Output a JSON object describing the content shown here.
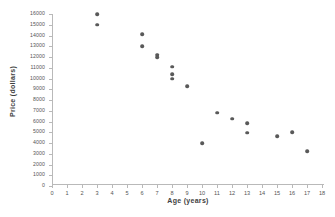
{
  "chart_data": {
    "type": "scatter",
    "title": "",
    "xlabel": "Age  (years)",
    "ylabel": "Price  (dollars)",
    "xlim": [
      0,
      18
    ],
    "ylim": [
      0,
      16000
    ],
    "xticks": [
      0,
      1,
      2,
      3,
      4,
      5,
      6,
      7,
      8,
      9,
      10,
      11,
      12,
      13,
      14,
      15,
      16,
      17,
      18
    ],
    "xtick_labels": [
      "0",
      "1",
      "2",
      "3",
      "4",
      "5",
      "6",
      "7",
      "8",
      "9",
      "10",
      "11",
      "12",
      "13",
      "14",
      "15",
      "16",
      "17",
      "18"
    ],
    "yticks": [
      0,
      1000,
      2000,
      3000,
      4000,
      5000,
      6000,
      7000,
      8000,
      9000,
      10000,
      11000,
      12000,
      13000,
      14000,
      15000,
      16000
    ],
    "ytick_labels": [
      "0",
      "1000",
      "2000",
      "3000",
      "4000",
      "5000",
      "6000",
      "7000",
      "8000",
      "9000",
      "10000",
      "11000",
      "12000",
      "13000",
      "14000",
      "15000",
      "16000"
    ],
    "grid": false,
    "legend": false,
    "marker_color": "#595959",
    "axis_color": "#b9b9b9",
    "points": [
      {
        "x": 3,
        "y": 16000
      },
      {
        "x": 3,
        "y": 15000
      },
      {
        "x": 6,
        "y": 14100
      },
      {
        "x": 6,
        "y": 13000
      },
      {
        "x": 7,
        "y": 12200
      },
      {
        "x": 7,
        "y": 12000
      },
      {
        "x": 8,
        "y": 11100
      },
      {
        "x": 8,
        "y": 10400
      },
      {
        "x": 8,
        "y": 10000
      },
      {
        "x": 9,
        "y": 9300
      },
      {
        "x": 10,
        "y": 4000
      },
      {
        "x": 11,
        "y": 6800
      },
      {
        "x": 12,
        "y": 6250
      },
      {
        "x": 13,
        "y": 5850
      },
      {
        "x": 13,
        "y": 4950
      },
      {
        "x": 15,
        "y": 4650
      },
      {
        "x": 16,
        "y": 5000
      },
      {
        "x": 17,
        "y": 3250
      }
    ]
  }
}
